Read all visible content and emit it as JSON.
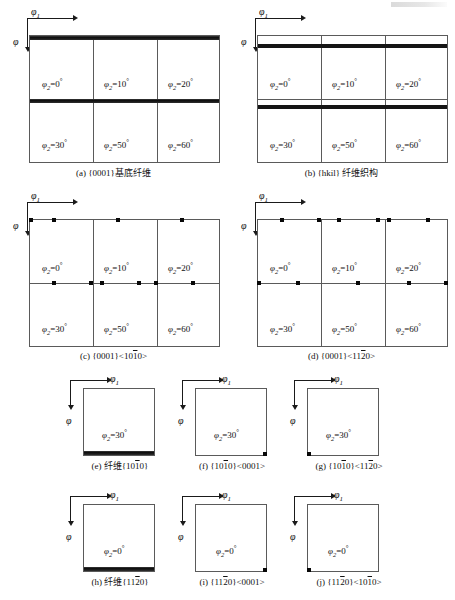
{
  "figure": {
    "type": "schematic-odf-sections",
    "axes": {
      "phi1_label": "φ1",
      "phi_label": "φ"
    },
    "phi2_values": [
      "φ2=0°",
      "φ2=10°",
      "φ2=20°",
      "φ2=30°",
      "φ2=50°",
      "φ2=60°"
    ]
  },
  "panels": [
    {
      "id": "a",
      "caption": "(a) {0001}基底纤维",
      "kind": "grid-3x2",
      "phi1": "φ1",
      "phi": "φ",
      "cells": [
        "φ2=0°",
        "φ2=10°",
        "φ2=20°",
        "φ2=30°",
        "φ2=50°",
        "φ2=60°"
      ],
      "features": "continuous black bands along the top edge of each row"
    },
    {
      "id": "b",
      "caption": "(b) {hkil} 纤维织构",
      "kind": "grid-3x2",
      "phi1": "φ1",
      "phi": "φ",
      "cells": [
        "φ2=0°",
        "φ2=10°",
        "φ2=20°",
        "φ2=30°",
        "φ2=50°",
        "φ2=60°"
      ],
      "features": "continuous black bands inset below the top edge of each row"
    },
    {
      "id": "c",
      "caption": "(c) {0001}<10̱0>",
      "caption_parts": {
        "prefix": "(c) {0001}<10",
        "overline": "1",
        "suffix": "0>"
      },
      "kind": "grid-3x2",
      "phi1": "φ1",
      "phi": "φ",
      "cells": [
        "φ2=0°",
        "φ2=10°",
        "φ2=20°",
        "φ2=30°",
        "φ2=50°",
        "φ2=60°"
      ],
      "features": "discrete square points on the top edges of both rows"
    },
    {
      "id": "d",
      "caption": "(d) {0001}<1120>",
      "caption_parts": {
        "prefix": "(d) {0001}<11",
        "overline": "2",
        "suffix": "0>"
      },
      "kind": "grid-3x2",
      "phi1": "φ1",
      "phi": "φ",
      "cells": [
        "φ2=0°",
        "φ2=10°",
        "φ2=20°",
        "φ2=30°",
        "φ2=50°",
        "φ2=60°"
      ],
      "features": "discrete square points on the top edges of both rows"
    },
    {
      "id": "e",
      "caption": "(e) 纤维{1010}",
      "caption_parts": {
        "prefix": "(e) 纤维{10",
        "overline": "1",
        "suffix": "0}"
      },
      "kind": "single",
      "phi1": "φ1",
      "phi": "φ",
      "cell": "φ2=30°",
      "features": "black band along the bottom edge"
    },
    {
      "id": "f",
      "caption": "(f) {1010}<0001>",
      "caption_parts": {
        "prefix": "(f) {10",
        "overline": "1",
        "suffix": "0}<0001>"
      },
      "kind": "single",
      "phi1": "φ1",
      "phi": "φ",
      "cell": "φ2=30°",
      "features": "square point at bottom-right corner"
    },
    {
      "id": "g",
      "caption": "(g) {1010}<1120>",
      "caption_parts": {
        "prefix": "(g) {10",
        "overline": "1",
        "mid": "0}<11",
        "overline2": "2",
        "suffix": "0>"
      },
      "kind": "single",
      "phi1": "φ1",
      "phi": "φ",
      "cell": "φ2=30°",
      "features": "square point at bottom-left corner"
    },
    {
      "id": "h",
      "caption": "(h) 纤维{1120}",
      "caption_parts": {
        "prefix": "(h) 纤维{11",
        "overline": "2",
        "suffix": "0}"
      },
      "kind": "single",
      "phi1": "φ1",
      "phi": "φ",
      "cell": "φ2=0°",
      "features": "black band along the bottom edge"
    },
    {
      "id": "i",
      "caption": "(i) {1120}<0001>",
      "caption_parts": {
        "prefix": "(i) {11",
        "overline": "2",
        "suffix": "0}<0001>"
      },
      "kind": "single",
      "phi1": "φ1",
      "phi": "φ",
      "cell": "φ2=0°",
      "features": "square point at bottom-right corner"
    },
    {
      "id": "j",
      "caption": "(j) {1120}<1010>",
      "caption_parts": {
        "prefix": "(j) {11",
        "overline": "2",
        "mid": "0}<10",
        "overline2": "1",
        "suffix": "0>"
      },
      "kind": "single",
      "phi1": "φ1",
      "phi": "φ",
      "cell": "φ2=0°",
      "features": "square point at bottom-left corner"
    }
  ],
  "labels": {
    "phi2_0": {
      "sym": "φ",
      "sub": "2",
      "eq": "=0",
      "deg": "°"
    },
    "phi2_10": {
      "sym": "φ",
      "sub": "2",
      "eq": "=10",
      "deg": "°"
    },
    "phi2_20": {
      "sym": "φ",
      "sub": "2",
      "eq": "=20",
      "deg": "°"
    },
    "phi2_30": {
      "sym": "φ",
      "sub": "2",
      "eq": "=30",
      "deg": "°"
    },
    "phi2_50": {
      "sym": "φ",
      "sub": "2",
      "eq": "=50",
      "deg": "°"
    },
    "phi2_60": {
      "sym": "φ",
      "sub": "2",
      "eq": "=60",
      "deg": "°"
    }
  }
}
